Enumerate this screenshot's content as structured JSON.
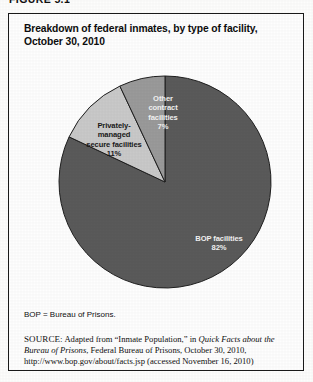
{
  "figure": {
    "label": "FIGURE 5.1",
    "title_line1": "Breakdown of federal inmates, by type of facility,",
    "title_line2": "October 30, 2010"
  },
  "notes": {
    "abbreviation": "BOP = Bureau of Prisons.",
    "source_key": "SOURCE:",
    "source_text_1": " Adapted from “Inmate Population,” in ",
    "source_italic_1": "Quick Facts about the Bureau of Prisons",
    "source_text_2": ", Federal Bureau of Prisons, October 30, 2010, http://www.bop.gov/about/facts.jsp (accessed November 16, 2010)"
  },
  "colors": {
    "bop_slice": "#5a5a5a",
    "private_slice": "#c9c9c9",
    "other_slice": "#9a9a9a",
    "slice_outline": "#1f1f1f",
    "frame": "#1a1a1a",
    "text_dark": "#111111",
    "text_light": "#f2f2f2"
  },
  "labels": {
    "bop_name": "BOP facilities",
    "bop_value": "82%",
    "private_name_1": "Privately-",
    "private_name_2": "managed",
    "private_name_3": "secure facilities",
    "private_value": "11%",
    "other_name_1": "Other",
    "other_name_2": "contract",
    "other_name_3": "facilities",
    "other_value": "7%"
  },
  "chart_data": {
    "type": "pie",
    "title": "Breakdown of federal inmates, by type of facility, October 30, 2010",
    "subtitle": "",
    "xlabel": "",
    "ylabel": "",
    "unit": "percent",
    "total": 100,
    "start_angle_deg": 0,
    "direction": "clockwise",
    "legend_position": "inline-labels",
    "grid": false,
    "categories": [
      "BOP facilities",
      "Privately-managed secure facilities",
      "Other contract facilities"
    ],
    "values": [
      82,
      11,
      7
    ],
    "slices": [
      {
        "label": "BOP facilities",
        "value": 82,
        "display": "82%",
        "color": "#5a5a5a",
        "label_color": "#f2f2f2"
      },
      {
        "label": "Privately-managed secure facilities",
        "value": 11,
        "display": "11%",
        "color": "#c9c9c9",
        "label_color": "#1a1a1a"
      },
      {
        "label": "Other contract facilities",
        "value": 7,
        "display": "7%",
        "color": "#9a9a9a",
        "label_color": "#f2f2f2"
      }
    ],
    "annotations": [
      "BOP = Bureau of Prisons."
    ]
  }
}
